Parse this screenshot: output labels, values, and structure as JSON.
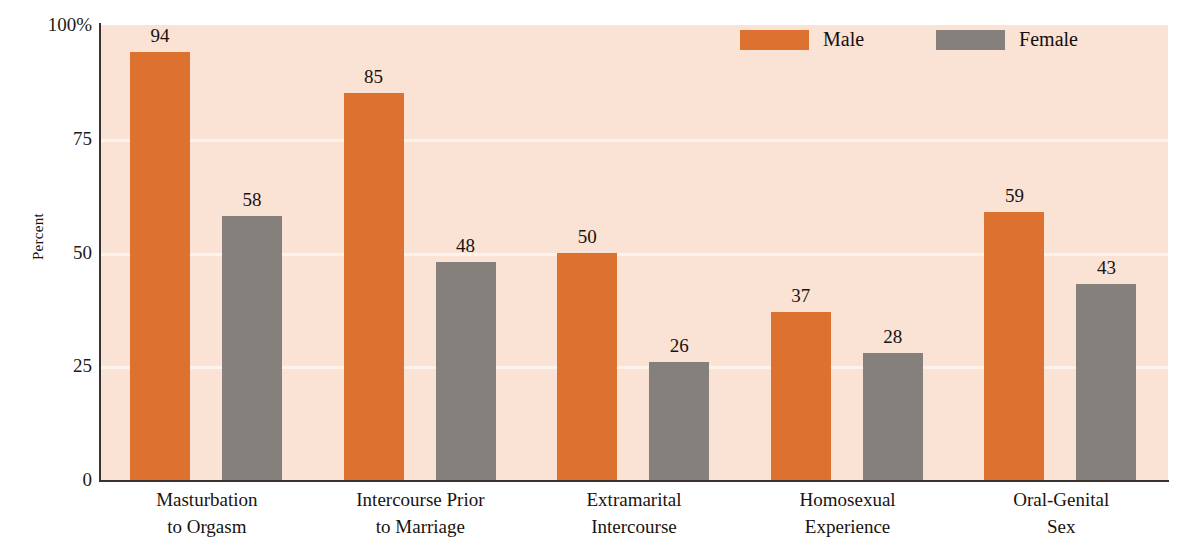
{
  "chart_data": {
    "type": "bar",
    "title": "",
    "xlabel": "",
    "ylabel": "Percent",
    "ylim": [
      0,
      100
    ],
    "grid": true,
    "legend_position": "top-right",
    "categories": [
      "Masturbation to Orgasm",
      "Intercourse Prior to Marriage",
      "Extramarital Intercourse",
      "Homosexual Experience",
      "Oral-Genital Sex"
    ],
    "category_lines": [
      [
        "Masturbation",
        "to Orgasm"
      ],
      [
        "Intercourse Prior",
        "to Marriage"
      ],
      [
        "Extramarital",
        "Intercourse"
      ],
      [
        "Homosexual",
        "Experience"
      ],
      [
        "Oral-Genital",
        "Sex"
      ]
    ],
    "series": [
      {
        "name": "Male",
        "color": "#DC7130",
        "values": [
          94,
          85,
          50,
          37,
          59
        ]
      },
      {
        "name": "Female",
        "color": "#85807B",
        "values": [
          58,
          48,
          26,
          28,
          43
        ]
      }
    ],
    "y_ticks": [
      {
        "value": 100,
        "label": "100%"
      },
      {
        "value": 75,
        "label": "75"
      },
      {
        "value": 50,
        "label": "50"
      },
      {
        "value": 25,
        "label": "25"
      },
      {
        "value": 0,
        "label": "0"
      }
    ]
  },
  "colors": {
    "male": "#DC7130",
    "female": "#85807B",
    "plot_background": "#FAE2D5",
    "gridline": "#FDF3EC",
    "axis": "#3A3230",
    "page_background": "#FFFFFF",
    "text": "#191310"
  }
}
